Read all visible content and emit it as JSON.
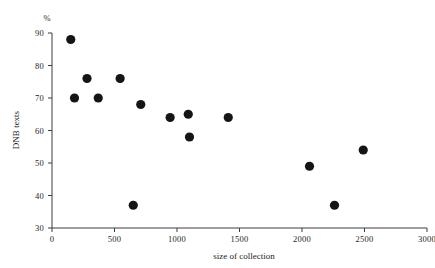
{
  "chart_data": {
    "type": "scatter",
    "title": "",
    "xlabel": "size of collection",
    "ylabel": "DNB texts",
    "unit_label": "%",
    "xlim": [
      0,
      3000
    ],
    "ylim": [
      30,
      90
    ],
    "xticks": [
      0,
      500,
      1000,
      1500,
      2000,
      2500,
      3000
    ],
    "yticks": [
      30,
      40,
      50,
      60,
      70,
      80,
      90
    ],
    "xtick_labels": [
      "0",
      "500",
      "1000",
      "1500",
      "2000",
      "2500",
      "3000"
    ],
    "ytick_labels": [
      "30",
      "40",
      "50",
      "60",
      "70",
      "80",
      "90"
    ],
    "grid": false,
    "legend": "none",
    "marker": "filled-circle",
    "marker_color": "#151515",
    "marker_size": 4.6,
    "points": [
      {
        "x": 150,
        "y": 88
      },
      {
        "x": 180,
        "y": 70
      },
      {
        "x": 280,
        "y": 76
      },
      {
        "x": 370,
        "y": 70
      },
      {
        "x": 545,
        "y": 76
      },
      {
        "x": 650,
        "y": 37
      },
      {
        "x": 710,
        "y": 68
      },
      {
        "x": 945,
        "y": 64
      },
      {
        "x": 1090,
        "y": 65
      },
      {
        "x": 1100,
        "y": 58
      },
      {
        "x": 1410,
        "y": 64
      },
      {
        "x": 2060,
        "y": 49
      },
      {
        "x": 2260,
        "y": 37
      },
      {
        "x": 2490,
        "y": 54
      }
    ]
  },
  "axes": {
    "x_axis_name": "x-axis",
    "y_axis_name": "y-axis"
  }
}
